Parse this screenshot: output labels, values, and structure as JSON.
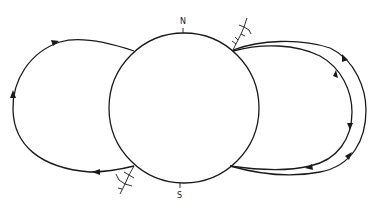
{
  "diagram": {
    "type": "magnetic-field-loops",
    "labels": {
      "north": "N",
      "south": "S"
    },
    "elements": [
      {
        "name": "central-sphere",
        "kind": "circle"
      },
      {
        "name": "left-loop",
        "kind": "closed-field-line",
        "direction": "counterclockwise"
      },
      {
        "name": "right-outer-loop",
        "kind": "closed-field-line"
      },
      {
        "name": "right-inner-loop",
        "kind": "closed-field-line"
      },
      {
        "name": "lightning-north-east",
        "kind": "discharge-symbol"
      },
      {
        "name": "lightning-south-west",
        "kind": "discharge-symbol"
      }
    ],
    "colors": {
      "line": "#1a1a1a",
      "background": "#ffffff"
    }
  }
}
